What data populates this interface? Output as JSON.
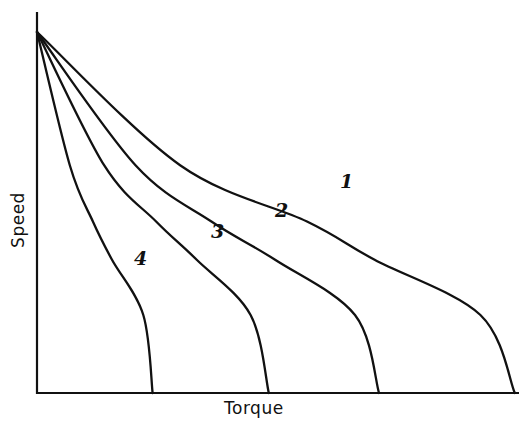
{
  "chart_data": {
    "type": "line",
    "title": "",
    "xlabel": "Torque",
    "ylabel": "Speed",
    "xlim": [
      0,
      1
    ],
    "ylim": [
      0,
      1
    ],
    "grid": false,
    "legend": "none (curves labeled inline)",
    "ticks": "none",
    "series": [
      {
        "name": "1",
        "points": [
          [
            0,
            1.0
          ],
          [
            0.292,
            0.631
          ],
          [
            0.551,
            0.475
          ],
          [
            0.689,
            0.369
          ],
          [
            0.905,
            0.216
          ],
          [
            0.975,
            0.0
          ]
        ]
      },
      {
        "name": "2",
        "points": [
          [
            0,
            1.0
          ],
          [
            0.201,
            0.631
          ],
          [
            0.356,
            0.475
          ],
          [
            0.486,
            0.369
          ],
          [
            0.649,
            0.216
          ],
          [
            0.698,
            0.0
          ]
        ]
      },
      {
        "name": "3",
        "points": [
          [
            0,
            1.0
          ],
          [
            0.137,
            0.631
          ],
          [
            0.243,
            0.475
          ],
          [
            0.326,
            0.369
          ],
          [
            0.436,
            0.216
          ],
          [
            0.473,
            0.0
          ]
        ]
      },
      {
        "name": "4",
        "points": [
          [
            0,
            1.0
          ],
          [
            0.067,
            0.631
          ],
          [
            0.114,
            0.475
          ],
          [
            0.153,
            0.369
          ],
          [
            0.217,
            0.216
          ],
          [
            0.236,
            0.0
          ]
        ]
      }
    ]
  },
  "labels": {
    "xlabel": "Torque",
    "ylabel": "Speed",
    "curve_1": "1",
    "curve_2": "2",
    "curve_3": "3",
    "curve_4": "4"
  },
  "colors": {
    "line": "#111111",
    "background": "#ffffff"
  }
}
